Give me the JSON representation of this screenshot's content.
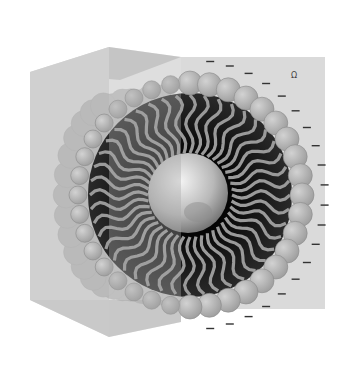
{
  "diagram": {
    "colors": {
      "background": "#ffffff",
      "box_back_wall": "#d8d8d8",
      "box_left_wall": "#cfcfcf",
      "box_top": "#c8c8c8",
      "box_front_translucent": "#b8b8b8",
      "head_group": "#b0b0b0",
      "head_group_stroke": "#8a8a8a",
      "tail_region": "#1a1a1a",
      "tail": "#9a9a9a",
      "core": "#d0d0d0",
      "charge_mark": "#333333"
    },
    "charge_symbol": "−",
    "charge_count": 20,
    "head_group_count": 36,
    "tail_count": 44,
    "corner_mark": "Ω"
  }
}
